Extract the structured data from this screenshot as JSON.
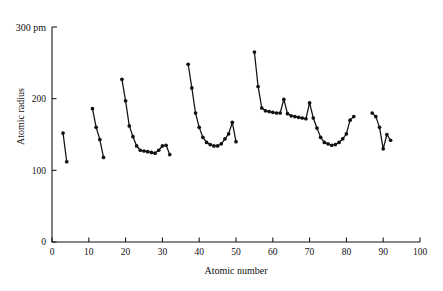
{
  "chart_data": {
    "type": "line",
    "title": "",
    "xlabel": "Atomic number",
    "ylabel": "Atomic radius",
    "y_unit_label": "300 pm",
    "xlim": [
      0,
      100
    ],
    "ylim": [
      0,
      300
    ],
    "xticks": [
      0,
      10,
      20,
      30,
      40,
      50,
      60,
      70,
      80,
      90,
      100
    ],
    "xtick_labels": [
      "0",
      "10",
      "20",
      "30",
      "40",
      "50",
      "60",
      "70",
      "80",
      "90",
      "100"
    ],
    "yticks": [
      0,
      100,
      200,
      300
    ],
    "ytick_labels": [
      "0",
      "100",
      "200",
      "300"
    ],
    "grid": false,
    "legend": false,
    "markers": "filled-circle",
    "series": [
      {
        "name": "period-2",
        "x": [
          3,
          4
        ],
        "values": [
          152,
          112
        ]
      },
      {
        "name": "period-3",
        "x": [
          11,
          12,
          13,
          14
        ],
        "values": [
          186,
          160,
          143,
          118
        ]
      },
      {
        "name": "period-4",
        "x": [
          19,
          20,
          21,
          22,
          23,
          24,
          25,
          26,
          27,
          28,
          29,
          30,
          31,
          32
        ],
        "values": [
          227,
          197,
          162,
          147,
          134,
          128,
          127,
          126,
          125,
          124,
          128,
          134,
          135,
          122
        ]
      },
      {
        "name": "period-5",
        "x": [
          37,
          38,
          39,
          40,
          41,
          42,
          43,
          44,
          45,
          46,
          47,
          48,
          49,
          50
        ],
        "values": [
          248,
          215,
          180,
          160,
          146,
          139,
          136,
          134,
          134,
          137,
          144,
          151,
          167,
          140
        ]
      },
      {
        "name": "period-6",
        "x": [
          55,
          56,
          57,
          58,
          59,
          60,
          61,
          62,
          63,
          64,
          65,
          66,
          67,
          68,
          69,
          70,
          71,
          72,
          73,
          74,
          75,
          76,
          77,
          78,
          79,
          80,
          81,
          82
        ],
        "values": [
          265,
          217,
          187,
          183,
          182,
          181,
          180,
          180,
          199,
          179,
          176,
          175,
          174,
          173,
          172,
          194,
          173,
          159,
          146,
          139,
          137,
          135,
          136,
          139,
          144,
          151,
          170,
          175
        ]
      },
      {
        "name": "period-7",
        "x": [
          87,
          88,
          89,
          90,
          91,
          92
        ],
        "values": [
          180,
          175,
          160,
          130,
          150,
          142
        ]
      }
    ]
  },
  "axes": {
    "y_corner_label": "300 pm",
    "x_axis_title": "Atomic number",
    "y_axis_title": "Atomic radius"
  }
}
